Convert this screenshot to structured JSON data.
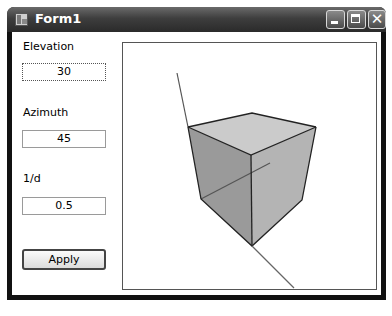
{
  "window": {
    "title": "Form1",
    "controls": {
      "minimize": "minimize",
      "maximize": "maximize",
      "close": "✕"
    }
  },
  "form": {
    "elevation": {
      "label": "Elevation",
      "value": "30"
    },
    "azimuth": {
      "label": "Azimuth",
      "value": "45"
    },
    "inverse_distance": {
      "label": "1/d",
      "value": "0.5"
    },
    "apply_label": "Apply"
  },
  "viewport": {
    "colors": {
      "top_face": "#c8c8c8",
      "left_face": "#9a9a9a",
      "right_face": "#b4b4b4",
      "edge": "#222222",
      "axis": "#555555"
    }
  }
}
